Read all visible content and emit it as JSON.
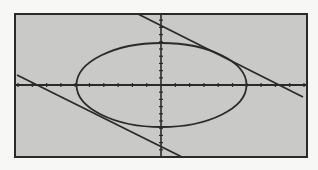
{
  "chart_data": {
    "type": "line",
    "title": "",
    "xlabel": "",
    "ylabel": "",
    "grid": false,
    "legend": null,
    "xlim": [
      -10,
      10
    ],
    "ylim": [
      -10,
      10
    ],
    "series": [
      {
        "name": "ellipse",
        "kind": "ellipse",
        "center": [
          0,
          0
        ],
        "semi_axis_x": 6,
        "semi_axis_y": 6
      },
      {
        "name": "upper tangent line",
        "kind": "line",
        "x_intercept": 8.6,
        "slope": -0.55
      },
      {
        "name": "lower tangent line",
        "kind": "line",
        "x_intercept": -8.6,
        "slope": -0.55
      }
    ]
  },
  "screen": {
    "background": "#f7f7f5",
    "plot_fill": "#c9c9c7",
    "ink": "#2a2a2a",
    "frame": {
      "x1": 15,
      "y1": 14,
      "x2": 307,
      "y2": 157
    },
    "origin": {
      "x": 161,
      "y": 85
    },
    "x_tick_spacing": 14.3,
    "y_tick_spacing": 7.2,
    "ellipse_px": {
      "cx": 161.5,
      "cy": 85,
      "rx": 85,
      "ry": 42
    },
    "upper_line_px": {
      "x1": 138,
      "y1": 14,
      "x2": 303,
      "y2": 97
    },
    "lower_line_px": {
      "x1": 17,
      "y1": 75,
      "x2": 182,
      "y2": 157
    }
  }
}
